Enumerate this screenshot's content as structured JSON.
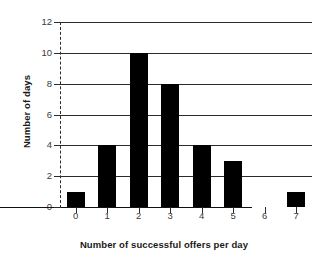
{
  "chart_data": {
    "type": "bar",
    "title": "",
    "xlabel": "Number of successful offers per day",
    "ylabel": "Number of days",
    "categories": [
      "0",
      "1",
      "2",
      "3",
      "4",
      "5",
      "6",
      "7"
    ],
    "values": [
      1,
      4,
      10,
      8,
      4,
      3,
      0,
      1
    ],
    "yticks": [
      "0",
      "2",
      "4",
      "6",
      "8",
      "10",
      "12"
    ],
    "ytick_values": [
      0,
      2,
      4,
      6,
      8,
      10,
      12
    ],
    "ylim": [
      0,
      12
    ],
    "xlim": [
      -0.5,
      7.5
    ],
    "grid": "horizontal",
    "legend": "none",
    "bar_color": "#000000",
    "grid_color": "#2b2b2b",
    "axis_color": "#2b2b2b",
    "background": "#ffffff"
  }
}
